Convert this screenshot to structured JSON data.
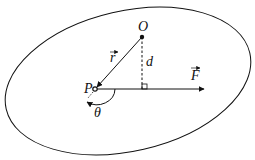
{
  "diagram": {
    "type": "torque-geometry",
    "labels": {
      "origin": "O",
      "point": "P",
      "position_vector": "r",
      "force": "F",
      "lever_arm": "d",
      "angle": "θ"
    },
    "colors": {
      "stroke": "#111111",
      "background": "#ffffff"
    }
  }
}
